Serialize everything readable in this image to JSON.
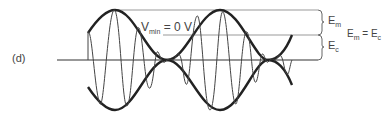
{
  "figure": {
    "panel_label": "(d)",
    "vmin_label": {
      "main": "V",
      "sub": "min",
      "rest": " = 0 V"
    },
    "em_label": {
      "main": "E",
      "sub": "m"
    },
    "ec_label": {
      "main": "E",
      "sub": "c"
    },
    "equality_label": {
      "left_main": "E",
      "left_sub": "m",
      "eq": " = ",
      "right_main": "E",
      "right_sub": "c"
    }
  }
}
